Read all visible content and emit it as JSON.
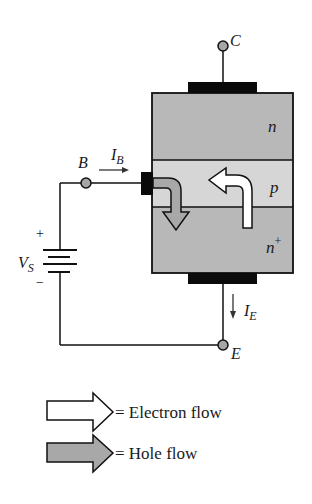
{
  "diagram": {
    "title": "",
    "terminals": {
      "collector": {
        "label": "C"
      },
      "base": {
        "label": "B"
      },
      "emitter": {
        "label": "E"
      }
    },
    "regions": [
      {
        "name": "collector-region",
        "label": "n",
        "superscript": ""
      },
      {
        "name": "base-region",
        "label": "p",
        "superscript": ""
      },
      {
        "name": "emitter-region",
        "label": "n",
        "superscript": "+"
      }
    ],
    "currents": {
      "base_current": {
        "label": "I",
        "subscript": "B"
      },
      "emitter_current": {
        "label": "I",
        "subscript": "E"
      }
    },
    "source": {
      "label": "V",
      "subscript": "S",
      "plus": "+",
      "minus": "−"
    },
    "legend": [
      {
        "name": "electron-flow",
        "text": "= Electron flow",
        "fill": "#ffffff"
      },
      {
        "name": "hole-flow",
        "text": "= Hole flow",
        "fill": "#a8a8a8"
      }
    ],
    "colors": {
      "n_region": "#b8b8b8",
      "p_region": "#d6d6d6",
      "contact": "#0a0a0a",
      "node": "#a6a6a6",
      "wire": "#111111"
    }
  }
}
